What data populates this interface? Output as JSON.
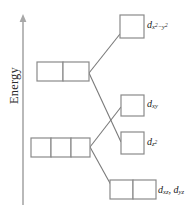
{
  "diagram": {
    "axis": {
      "label": "Energy",
      "direction": "up",
      "arrow_icon": "up-arrow-icon"
    },
    "colors": {
      "box_stroke": "#8a8a8a",
      "connector_stroke": "#7a7a7a",
      "axis_stroke": "#a8a8a8",
      "text": "#1a1a1a",
      "background": "#ffffff"
    },
    "levels": [
      {
        "id": "dx2-y2",
        "label_plain": "d x2-y2",
        "label_parts": {
          "d": "d",
          "sub_main": "x",
          "sup1": "2",
          "minus": "−",
          "sub2": "y",
          "sup2": "2"
        },
        "cells": 1,
        "side": "right"
      },
      {
        "id": "left-upper",
        "label_plain": "",
        "cells": 2,
        "side": "left"
      },
      {
        "id": "dxy",
        "label_plain": "d xy",
        "label_parts": {
          "d": "d",
          "sub_main": "xy"
        },
        "cells": 1,
        "side": "right"
      },
      {
        "id": "left-lower",
        "label_plain": "",
        "cells": 3,
        "side": "left"
      },
      {
        "id": "dz2",
        "label_plain": "d z2",
        "label_parts": {
          "d": "d",
          "sub_main": "z",
          "sup1": "2"
        },
        "cells": 1,
        "side": "right"
      },
      {
        "id": "dxz-dyz",
        "label_plain": "d xz, d yz",
        "label_parts": {
          "d": "d",
          "sub_main": "xz",
          "comma": ",",
          "d2": "d",
          "sub_main2": "yz"
        },
        "cells": 2,
        "side": "right"
      }
    ]
  }
}
